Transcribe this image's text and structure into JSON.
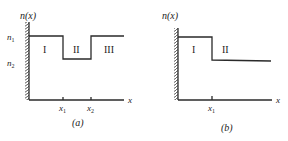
{
  "figure": {
    "panels": [
      {
        "id": "a",
        "caption": "(a)",
        "y_axis_label": "n(x)",
        "x_axis_label": "x",
        "level_labels": [
          {
            "base": "n",
            "sub": "1"
          },
          {
            "base": "n",
            "sub": "2"
          }
        ],
        "regions": [
          "I",
          "II",
          "III"
        ],
        "ticks": [
          {
            "base": "x",
            "sub": "1"
          },
          {
            "base": "x",
            "sub": "2"
          }
        ],
        "profile": "step: n1 for 0<x<x1, n2 for x1<x<x2, n1 for x>x2"
      },
      {
        "id": "b",
        "caption": "(b)",
        "y_axis_label": "n(x)",
        "x_axis_label": "x",
        "regions": [
          "I",
          "II"
        ],
        "ticks": [
          {
            "base": "x",
            "sub": "1"
          }
        ],
        "profile": "step: n1 for 0<x<x1, lower value for x>x1"
      }
    ]
  },
  "colors": {
    "line": "#2a2a2a",
    "background": "#ffffff"
  }
}
